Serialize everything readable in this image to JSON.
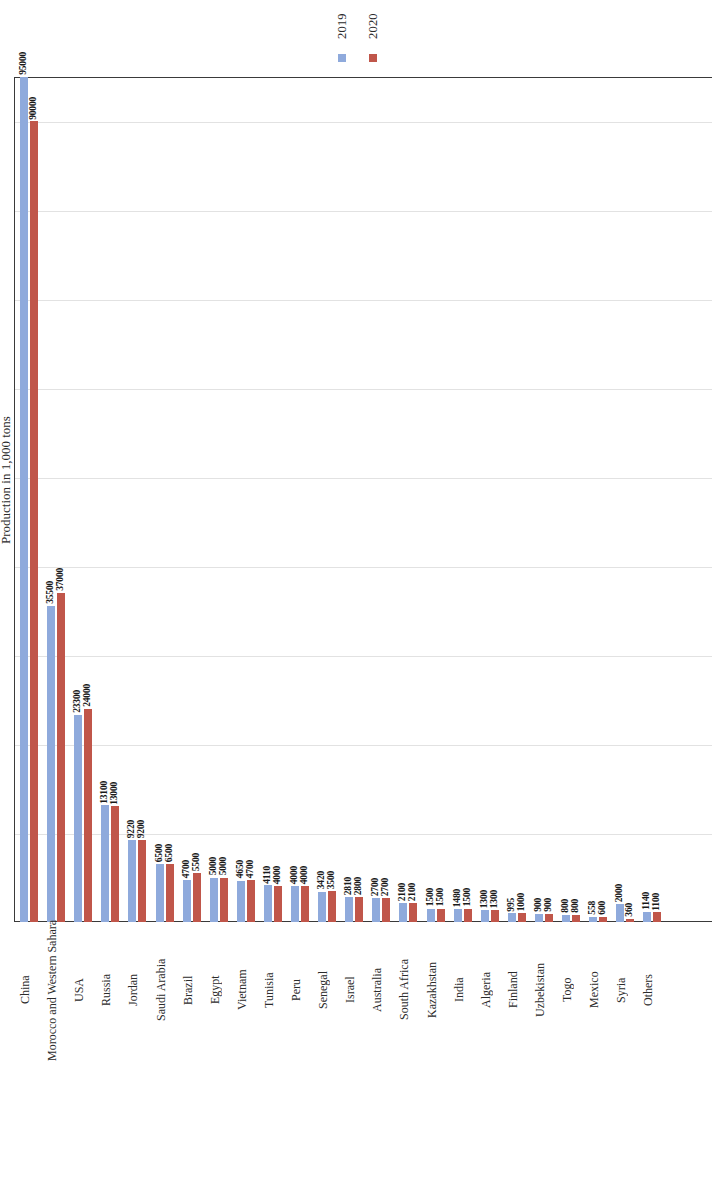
{
  "axis": {
    "y_title": "Production in 1,000 tons"
  },
  "legend": {
    "items": [
      {
        "label": "2019",
        "color": "#8FAADC"
      },
      {
        "label": "2020",
        "color": "#C0564A"
      }
    ]
  },
  "chart_data": {
    "type": "bar",
    "title": "",
    "subtitle": "",
    "xlabel": "",
    "ylabel": "Production in 1,000 tons",
    "ylim": [
      0,
      95000
    ],
    "grid": true,
    "legend_position": "top",
    "categories": [
      "China",
      "Morocco and Western Sahara",
      "USA",
      "Russia",
      "Jordan",
      "Saudi Arabia",
      "Brazil",
      "Egypt",
      "Vietnam",
      "Tunisia",
      "Peru",
      "Senegal",
      "Israel",
      "Australia",
      "South Africa",
      "Kazakhstan",
      "India",
      "Algeria",
      "Finland",
      "Uzbekistan",
      "Togo",
      "Mexico",
      "Syria",
      "Others"
    ],
    "series": [
      {
        "name": "2019",
        "color": "#8FAADC",
        "values": [
          95000,
          35500,
          23300,
          13100,
          9220,
          6500,
          4700,
          5000,
          4650,
          4110,
          4000,
          3420,
          2810,
          2700,
          2100,
          1500,
          1480,
          1300,
          995,
          900,
          800,
          558,
          2000,
          1140
        ]
      },
      {
        "name": "2020",
        "color": "#C0564A",
        "values": [
          90000,
          37000,
          24000,
          13000,
          9200,
          6500,
          5500,
          5000,
          4700,
          4000,
          4000,
          3500,
          2800,
          2700,
          2100,
          1500,
          1500,
          1300,
          1000,
          900,
          800,
          600,
          360,
          1100
        ]
      }
    ],
    "gridline_values": [
      10000,
      20000,
      30000,
      40000,
      50000,
      60000,
      70000,
      80000,
      90000
    ]
  }
}
